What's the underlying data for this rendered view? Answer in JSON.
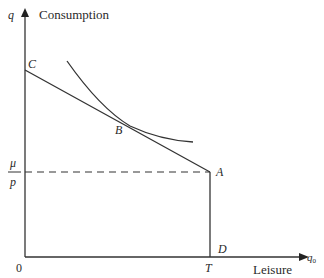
{
  "diagram": {
    "y_axis": {
      "symbol": "q",
      "label": "Consumption"
    },
    "x_axis": {
      "symbol": "q",
      "subscript": "0",
      "label": "Leisure"
    },
    "origin": "0",
    "y_tick_numerator": "μ",
    "y_tick_denominator": "p",
    "x_tick": "T",
    "points": {
      "A": "A",
      "B": "B",
      "C": "C",
      "D": "D"
    },
    "colors": {
      "line": "#333333",
      "text": "#2a2a2a"
    }
  }
}
